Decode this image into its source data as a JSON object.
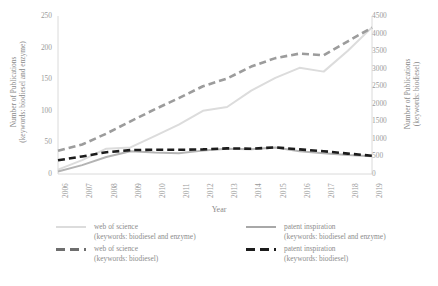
{
  "chart_data": {
    "type": "line",
    "title": "",
    "xlabel": "Year",
    "ylabel": "Number of Publications (keywords: biodiesel and enzyme)",
    "ylabel_right": "Number of Publications (keywords: biodiesel)",
    "categories": [
      "2006",
      "2007",
      "2008",
      "2009",
      "2010",
      "2011",
      "2012",
      "2013",
      "2014",
      "2015",
      "2016",
      "2017",
      "2018",
      "2019"
    ],
    "x": [
      2006,
      2007,
      2008,
      2009,
      2010,
      2011,
      2012,
      2013,
      2014,
      2015,
      2016,
      2017,
      2018,
      2019
    ],
    "ylim": [
      0,
      250
    ],
    "yticks": [
      "0",
      "50",
      "100",
      "150",
      "200",
      "250"
    ],
    "ylim_right": [
      0,
      4500
    ],
    "yticks_right": [
      "0",
      "500",
      "1000",
      "1500",
      "2000",
      "2500",
      "3000",
      "3500",
      "4000",
      "4500"
    ],
    "grid": false,
    "legend_position": "bottom",
    "series": [
      {
        "name": "web of science (keywords: biodiesel and enzyme)",
        "axis": "left",
        "style": "solid",
        "color": "#dcdcdc",
        "values": [
          7,
          22,
          40,
          42,
          60,
          78,
          100,
          106,
          132,
          152,
          168,
          162,
          195,
          232
        ]
      },
      {
        "name": "web of science (keywords: biodiesel)",
        "axis": "right",
        "style": "dashed",
        "color": "#9c9c9c",
        "values": [
          660,
          840,
          1150,
          1500,
          1840,
          2160,
          2500,
          2720,
          3060,
          3300,
          3430,
          3380,
          3780,
          4170
        ]
      },
      {
        "name": "patent inspiration (keywords: biodiesel and enzyme)",
        "axis": "left",
        "style": "solid",
        "color": "#b4b4b4",
        "values": [
          4,
          14,
          27,
          36,
          34,
          33,
          37,
          40,
          39,
          42,
          36,
          33,
          30,
          28
        ]
      },
      {
        "name": "patent inspiration (keywords: biodiesel)",
        "axis": "right",
        "style": "dashed",
        "color": "#1c1c1c",
        "values": [
          390,
          500,
          620,
          680,
          690,
          690,
          700,
          730,
          720,
          760,
          700,
          650,
          580,
          520
        ]
      }
    ]
  },
  "legend": {
    "entries": [
      {
        "line1": "web of science",
        "line2": "(keywords: biodiesel and enzyme)",
        "style": "solid",
        "color": "#dcdcdc"
      },
      {
        "line1": "patent inspiration",
        "line2": "(keywords: biodiesel and enzyme)",
        "style": "solid",
        "color": "#a8a8a8"
      },
      {
        "line1": "web of science",
        "line2": "(keywords: biodiesel)",
        "style": "dashed",
        "color": "#6e6e6e"
      },
      {
        "line1": "patent inspiration",
        "line2": "(keywords: biodiesel)",
        "style": "dashed",
        "color": "#1c1c1c"
      }
    ]
  },
  "axis_titles": {
    "left_line1": "Number of Publications",
    "left_line2": "(keywords: biodiesel and enzyme)",
    "right_line1": "Number of Publications",
    "right_line2": "(keywords: biodiesel)",
    "x": "Year"
  }
}
